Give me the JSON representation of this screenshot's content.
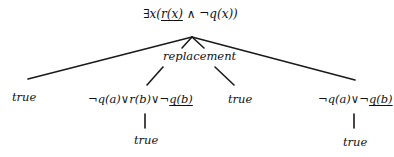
{
  "diagram": {
    "type": "derivation-tree",
    "root": {
      "pre": "∃x(",
      "underlined": "r(x)",
      "post": " ∧ ¬q(x))"
    },
    "edge_label": "replacement",
    "nodes": [
      {
        "id": "leaf1",
        "text": "true"
      },
      {
        "id": "child2",
        "pre": "¬q(a)∨r(b)∨¬",
        "underlined": "q(b)"
      },
      {
        "id": "leaf3",
        "text": "true"
      },
      {
        "id": "child4",
        "pre": "¬q(a)∨¬",
        "underlined": "q(b)"
      }
    ],
    "children_of": {
      "child2": {
        "text": "true"
      },
      "child4": {
        "text": "true"
      }
    }
  }
}
